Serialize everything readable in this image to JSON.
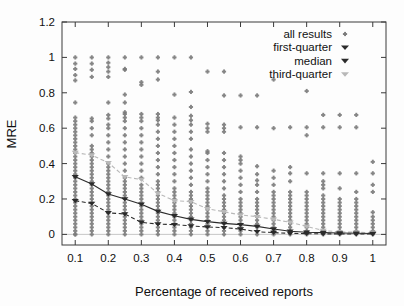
{
  "chart_data": {
    "type": "scatter",
    "title": "",
    "xlabel": "Percentage of received reports",
    "ylabel": "MRE",
    "xlim": [
      0.06,
      1.04
    ],
    "ylim": [
      -0.06,
      1.2
    ],
    "xticks": [
      0.1,
      0.2,
      0.3,
      0.4,
      0.5,
      0.6,
      0.7,
      0.8,
      0.9,
      1
    ],
    "xticklabels": [
      "0.1",
      "0.2",
      "0.3",
      "0.4",
      "0.5",
      "0.6",
      "0.7",
      "0.8",
      "0.9",
      "1"
    ],
    "yticks": [
      0,
      0.2,
      0.4,
      0.6,
      0.8,
      1,
      1.2
    ],
    "yticklabels": [
      "0",
      "0.2",
      "0.4",
      "0.6",
      "0.8",
      "1",
      "1.2"
    ],
    "grid": false,
    "legend_position": "top-right",
    "x": [
      0.1,
      0.15,
      0.2,
      0.25,
      0.3,
      0.35,
      0.4,
      0.45,
      0.5,
      0.55,
      0.6,
      0.65,
      0.7,
      0.75,
      0.8,
      0.85,
      0.9,
      0.95,
      1.0
    ],
    "legend": [
      {
        "label": "all results",
        "marker": "dot",
        "color": "#7c7c7c"
      },
      {
        "label": "first-quarter",
        "marker": "triangle-down",
        "color": "#2b2b2b"
      },
      {
        "label": "median",
        "marker": "triangle-down",
        "color": "#2b2b2b"
      },
      {
        "label": "third-quarter",
        "marker": "triangle-down",
        "color": "#b8b8b8"
      }
    ],
    "series": [
      {
        "name": "median",
        "marker": "triangle-down",
        "color": "#2b2b2b",
        "linestyle": "solid",
        "values": [
          0.325,
          0.285,
          0.228,
          0.2,
          0.17,
          0.13,
          0.105,
          0.085,
          0.072,
          0.062,
          0.055,
          0.045,
          0.03,
          0.018,
          0.012,
          0.01,
          0.008,
          0.006,
          0.005
        ]
      },
      {
        "name": "first-quarter",
        "marker": "triangle-down",
        "color": "#2b2b2b",
        "linestyle": "dashed",
        "values": [
          0.19,
          0.175,
          0.122,
          0.115,
          0.068,
          0.058,
          0.055,
          0.048,
          0.042,
          0.038,
          0.03,
          0.015,
          0.01,
          0.006,
          0.004,
          0.003,
          0.003,
          0.002,
          0.002
        ]
      },
      {
        "name": "third-quarter",
        "marker": "triangle-down",
        "color": "#b8b8b8",
        "linestyle": "dashed",
        "values": [
          0.462,
          0.448,
          0.405,
          0.325,
          0.31,
          0.232,
          0.19,
          0.185,
          0.145,
          0.128,
          0.11,
          0.1,
          0.085,
          0.068,
          0.045,
          0.022,
          0.014,
          0.012,
          0.01
        ]
      }
    ],
    "all_results": {
      "name": "all results",
      "marker": "dot",
      "color": "#7c7c7c",
      "columns": [
        {
          "x": 0.1,
          "values": [
            0.0,
            0.0,
            0.02,
            0.04,
            0.06,
            0.08,
            0.1,
            0.12,
            0.14,
            0.16,
            0.18,
            0.2,
            0.22,
            0.24,
            0.26,
            0.28,
            0.3,
            0.32,
            0.34,
            0.36,
            0.38,
            0.4,
            0.42,
            0.44,
            0.46,
            0.48,
            0.5,
            0.52,
            0.54,
            0.56,
            0.58,
            0.6,
            0.62,
            0.64,
            0.66,
            0.745,
            0.87,
            0.9,
            0.935,
            0.965,
            1.0
          ]
        },
        {
          "x": 0.15,
          "values": [
            0.0,
            0.02,
            0.04,
            0.06,
            0.08,
            0.1,
            0.12,
            0.14,
            0.16,
            0.18,
            0.2,
            0.22,
            0.24,
            0.26,
            0.28,
            0.3,
            0.32,
            0.34,
            0.36,
            0.38,
            0.4,
            0.42,
            0.44,
            0.46,
            0.48,
            0.5,
            0.56,
            0.6,
            0.64,
            0.655,
            0.89,
            0.93,
            0.965,
            1.0
          ]
        },
        {
          "x": 0.2,
          "values": [
            0.0,
            0.02,
            0.04,
            0.06,
            0.08,
            0.1,
            0.12,
            0.14,
            0.16,
            0.18,
            0.2,
            0.22,
            0.24,
            0.26,
            0.28,
            0.3,
            0.32,
            0.34,
            0.36,
            0.38,
            0.4,
            0.44,
            0.48,
            0.52,
            0.56,
            0.6,
            0.62,
            0.655,
            0.675,
            0.745,
            0.89,
            0.92,
            0.945,
            0.97,
            1.0
          ]
        },
        {
          "x": 0.25,
          "values": [
            0.0,
            0.02,
            0.04,
            0.06,
            0.08,
            0.1,
            0.12,
            0.14,
            0.16,
            0.18,
            0.2,
            0.22,
            0.24,
            0.26,
            0.28,
            0.3,
            0.32,
            0.36,
            0.4,
            0.44,
            0.48,
            0.52,
            0.56,
            0.6,
            0.64,
            0.66,
            0.68,
            0.69,
            0.745,
            0.79,
            0.93,
            0.935,
            1.0
          ]
        },
        {
          "x": 0.3,
          "values": [
            0.0,
            0.02,
            0.04,
            0.06,
            0.08,
            0.1,
            0.12,
            0.14,
            0.16,
            0.18,
            0.2,
            0.22,
            0.24,
            0.26,
            0.28,
            0.32,
            0.36,
            0.4,
            0.44,
            0.48,
            0.52,
            0.56,
            0.6,
            0.64,
            0.66,
            0.68,
            0.845,
            0.86,
            1.0
          ]
        },
        {
          "x": 0.35,
          "values": [
            0.0,
            0.02,
            0.04,
            0.06,
            0.08,
            0.1,
            0.12,
            0.14,
            0.16,
            0.18,
            0.2,
            0.22,
            0.24,
            0.26,
            0.28,
            0.3,
            0.34,
            0.38,
            0.42,
            0.46,
            0.5,
            0.54,
            0.58,
            0.62,
            0.645,
            0.66,
            0.68,
            0.875,
            0.92,
            1.0
          ]
        },
        {
          "x": 0.4,
          "values": [
            0.0,
            0.02,
            0.04,
            0.06,
            0.08,
            0.1,
            0.12,
            0.14,
            0.16,
            0.18,
            0.2,
            0.22,
            0.24,
            0.26,
            0.3,
            0.34,
            0.38,
            0.42,
            0.46,
            0.5,
            0.54,
            0.58,
            0.62,
            0.66,
            0.79,
            1.0
          ]
        },
        {
          "x": 0.45,
          "values": [
            0.0,
            0.02,
            0.04,
            0.06,
            0.08,
            0.1,
            0.12,
            0.14,
            0.16,
            0.18,
            0.2,
            0.22,
            0.24,
            0.28,
            0.32,
            0.36,
            0.4,
            0.44,
            0.48,
            0.54,
            0.58,
            0.62,
            0.645,
            0.67,
            0.72,
            0.805,
            1.0
          ]
        },
        {
          "x": 0.5,
          "values": [
            0.0,
            0.02,
            0.04,
            0.06,
            0.08,
            0.1,
            0.12,
            0.14,
            0.16,
            0.18,
            0.2,
            0.22,
            0.24,
            0.26,
            0.3,
            0.34,
            0.38,
            0.42,
            0.46,
            0.47,
            0.58,
            0.6,
            0.625,
            0.92
          ]
        },
        {
          "x": 0.55,
          "values": [
            0.0,
            0.02,
            0.04,
            0.06,
            0.08,
            0.1,
            0.12,
            0.14,
            0.16,
            0.18,
            0.2,
            0.22,
            0.26,
            0.3,
            0.34,
            0.38,
            0.42,
            0.46,
            0.58,
            0.6,
            0.62,
            0.785,
            0.92
          ]
        },
        {
          "x": 0.6,
          "values": [
            0.0,
            0.02,
            0.04,
            0.06,
            0.08,
            0.1,
            0.12,
            0.14,
            0.16,
            0.18,
            0.2,
            0.24,
            0.28,
            0.32,
            0.36,
            0.4,
            0.42,
            0.44,
            0.605,
            0.785
          ]
        },
        {
          "x": 0.65,
          "values": [
            0.0,
            0.02,
            0.04,
            0.06,
            0.08,
            0.1,
            0.12,
            0.14,
            0.16,
            0.18,
            0.2,
            0.24,
            0.28,
            0.305,
            0.34,
            0.385,
            0.605,
            0.785
          ]
        },
        {
          "x": 0.7,
          "values": [
            0.0,
            0.02,
            0.04,
            0.06,
            0.08,
            0.1,
            0.12,
            0.14,
            0.16,
            0.18,
            0.2,
            0.22,
            0.24,
            0.28,
            0.32,
            0.36,
            0.6,
            0.875
          ]
        },
        {
          "x": 0.75,
          "values": [
            0.0,
            0.02,
            0.04,
            0.06,
            0.08,
            0.1,
            0.12,
            0.14,
            0.16,
            0.18,
            0.2,
            0.22,
            0.24,
            0.3,
            0.345,
            0.38,
            0.605
          ]
        },
        {
          "x": 0.8,
          "values": [
            0.0,
            0.02,
            0.04,
            0.06,
            0.08,
            0.1,
            0.12,
            0.14,
            0.16,
            0.18,
            0.2,
            0.22,
            0.24,
            0.345,
            0.56,
            0.605,
            0.81
          ]
        },
        {
          "x": 0.85,
          "values": [
            0.0,
            0.02,
            0.04,
            0.06,
            0.08,
            0.1,
            0.12,
            0.14,
            0.16,
            0.18,
            0.2,
            0.22,
            0.26,
            0.28,
            0.3,
            0.345,
            0.605,
            0.675
          ]
        },
        {
          "x": 0.9,
          "values": [
            0.0,
            0.02,
            0.04,
            0.06,
            0.08,
            0.1,
            0.12,
            0.14,
            0.16,
            0.18,
            0.2,
            0.26,
            0.345,
            0.605,
            0.675
          ]
        },
        {
          "x": 0.95,
          "values": [
            0.0,
            0.02,
            0.04,
            0.06,
            0.08,
            0.1,
            0.12,
            0.14,
            0.16,
            0.18,
            0.2,
            0.24,
            0.345,
            0.605,
            0.675
          ]
        },
        {
          "x": 1.0,
          "values": [
            0.0,
            0.02,
            0.04,
            0.06,
            0.08,
            0.1,
            0.125,
            0.24,
            0.28,
            0.345,
            0.41
          ]
        }
      ]
    }
  },
  "colors": {
    "scatter": "#7c7c7c",
    "dark_series": "#2b2b2b",
    "light_series": "#b8b8b8",
    "axis": "#3a3a3a",
    "text": "#111111",
    "background": "#fdfdfd"
  }
}
